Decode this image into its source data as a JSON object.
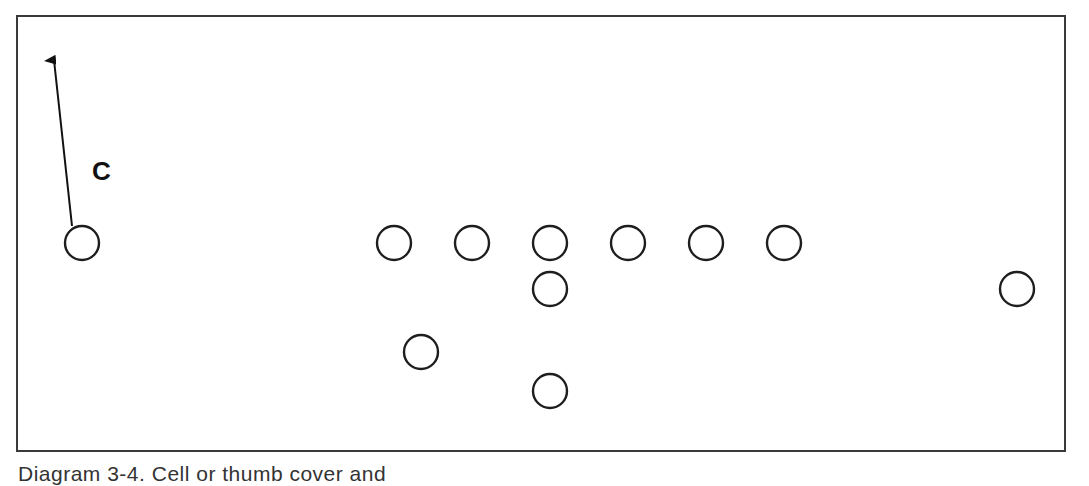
{
  "diagram": {
    "label": "C",
    "caption": "Diagram 3-4. Cell or thumb cover and",
    "players": [
      {
        "id": "corner-left",
        "role": "C"
      },
      {
        "id": "line-1"
      },
      {
        "id": "line-2"
      },
      {
        "id": "line-3"
      },
      {
        "id": "line-4"
      },
      {
        "id": "line-5"
      },
      {
        "id": "line-6"
      },
      {
        "id": "center-back"
      },
      {
        "id": "wide-right"
      },
      {
        "id": "back-left"
      },
      {
        "id": "deep-back"
      }
    ],
    "colors": {
      "stroke": "#1e1e1e",
      "frame": "#3a3a3a",
      "background": "#ffffff"
    }
  }
}
